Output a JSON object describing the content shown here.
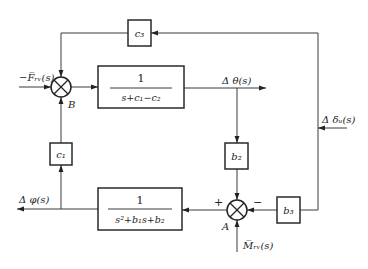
{
  "diagram": {
    "type": "control-block-diagram",
    "blocks": {
      "g1": {
        "numerator": "1",
        "denominator": "s+c₁−c₂"
      },
      "g2": {
        "numerator": "1",
        "denominator": "s²+b₁s+b₂"
      },
      "c3": {
        "label": "c₃"
      },
      "c1": {
        "label": "c₁"
      },
      "b2": {
        "label": "b₂"
      },
      "b3": {
        "label": "b₃"
      }
    },
    "junctions": {
      "B": {
        "label": "B"
      },
      "A": {
        "label": "A",
        "plus_sign": "+",
        "minus_sign": "−"
      }
    },
    "signals": {
      "input_F": "−F̅ᵣᵥ(s)",
      "theta": "Δ θ(s)",
      "delta": "Δ δᵤ(s)",
      "phi": "Δ φ(s)",
      "M": "M̅ᵣᵥ(s)"
    }
  }
}
